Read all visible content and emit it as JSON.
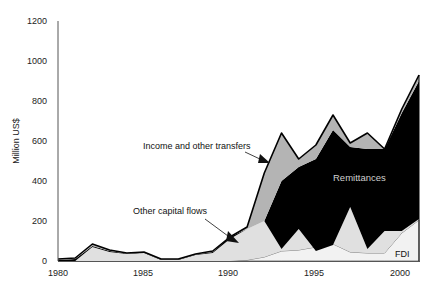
{
  "chart_data": {
    "type": "area",
    "stacked": true,
    "title": "",
    "xlabel": "",
    "ylabel": "Million US$",
    "ylim": [
      0,
      1200
    ],
    "yticks": [
      0,
      200,
      400,
      600,
      800,
      1000,
      1200
    ],
    "xlim": [
      1980,
      2001
    ],
    "xticks": [
      1980,
      1985,
      1990,
      1995,
      2000
    ],
    "grid": false,
    "legend": "inline annotations",
    "x": [
      1980,
      1981,
      1982,
      1983,
      1984,
      1985,
      1986,
      1987,
      1988,
      1989,
      1990,
      1991,
      1992,
      1993,
      1994,
      1995,
      1996,
      1997,
      1998,
      1999,
      2000,
      2001
    ],
    "series": [
      {
        "name": "FDI",
        "color": "#f2f2f2",
        "values": [
          0,
          0,
          0,
          0,
          0,
          0,
          0,
          0,
          0,
          0,
          0,
          5,
          20,
          50,
          55,
          70,
          85,
          45,
          40,
          40,
          140,
          205
        ]
      },
      {
        "name": "Other capital flows",
        "color": "#e0e0e0",
        "values": [
          0,
          0,
          70,
          45,
          35,
          40,
          5,
          5,
          30,
          40,
          110,
          155,
          180,
          10,
          105,
          -20,
          -5,
          225,
          20,
          110,
          10,
          5
        ]
      },
      {
        "name": "Remittances",
        "color": "#000000",
        "values": [
          5,
          10,
          5,
          5,
          3,
          3,
          3,
          3,
          3,
          5,
          10,
          0,
          0,
          340,
          310,
          460,
          575,
          300,
          500,
          410,
          590,
          690
        ]
      },
      {
        "name": "Income and other transfers",
        "color": "#b4b4b4",
        "values": [
          5,
          5,
          10,
          5,
          2,
          2,
          2,
          2,
          2,
          5,
          0,
          10,
          240,
          240,
          40,
          70,
          70,
          20,
          80,
          0,
          20,
          30
        ]
      }
    ],
    "totals": [
      10,
      15,
      85,
      55,
      40,
      45,
      10,
      10,
      35,
      50,
      120,
      170,
      440,
      640,
      510,
      580,
      730,
      590,
      640,
      560,
      760,
      930
    ],
    "annotations": [
      {
        "text": "Income and other transfers",
        "arrow_to_year": 1992
      },
      {
        "text": "Other capital flows",
        "arrow_to_year": 1990.5
      },
      {
        "text": "Remittances",
        "position": "inside"
      },
      {
        "text": "FDI",
        "position": "near 2000 bottom"
      }
    ]
  },
  "labels": {
    "ylabel": "Million US$",
    "income": "Income and other transfers",
    "other_capital": "Other capital flows",
    "remittances": "Remittances",
    "fdi": "FDI"
  },
  "axis": {
    "y_ticks": [
      "0",
      "200",
      "400",
      "600",
      "800",
      "1000",
      "1200"
    ],
    "x_ticks": [
      "1980",
      "1985",
      "1990",
      "1995",
      "2000"
    ]
  }
}
